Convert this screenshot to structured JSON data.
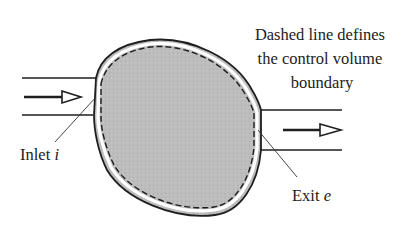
{
  "figure": {
    "type": "control-volume-diagram",
    "annotation": {
      "lines": [
        "Dashed line defines",
        "the control volume",
        "boundary"
      ]
    },
    "inlet": {
      "label": "Inlet",
      "symbol": "i"
    },
    "exit": {
      "label": "Exit",
      "symbol": "e"
    },
    "colors": {
      "fill": "#b8b8b8",
      "stroke": "#1e1e1e",
      "background": "#ffffff"
    }
  }
}
